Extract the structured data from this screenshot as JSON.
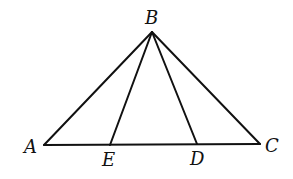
{
  "diagram": {
    "type": "triangle-with-cevians",
    "points": {
      "A": {
        "label": "A",
        "x": 44,
        "y": 145,
        "lx": 24,
        "ly": 153
      },
      "B": {
        "label": "B",
        "x": 152,
        "y": 32,
        "lx": 145,
        "ly": 24
      },
      "C": {
        "label": "C",
        "x": 260,
        "y": 144,
        "lx": 265,
        "ly": 152
      },
      "D": {
        "label": "D",
        "x": 197,
        "y": 144,
        "lx": 190,
        "ly": 165
      },
      "E": {
        "label": "E",
        "x": 110,
        "y": 145,
        "lx": 102,
        "ly": 166
      }
    },
    "segments": [
      {
        "name": "segment-ab",
        "from": "A",
        "to": "B"
      },
      {
        "name": "segment-bc",
        "from": "B",
        "to": "C"
      },
      {
        "name": "segment-ac",
        "from": "A",
        "to": "C"
      },
      {
        "name": "segment-be",
        "from": "B",
        "to": "E"
      },
      {
        "name": "segment-bd",
        "from": "B",
        "to": "D"
      }
    ],
    "colors": {
      "stroke": "#111111",
      "background": "#ffffff"
    }
  }
}
